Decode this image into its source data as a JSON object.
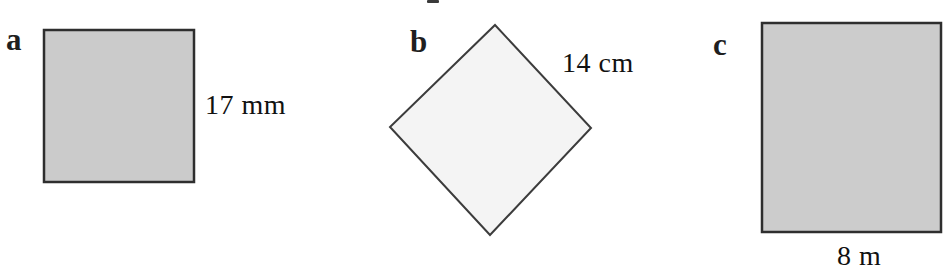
{
  "figures": [
    {
      "label": "a",
      "measurement": "17 mm",
      "shape": "square",
      "orientation": "upright",
      "fill": "#cbcbcb",
      "stroke": "#2e2e2e"
    },
    {
      "label": "b",
      "measurement": "14 cm",
      "shape": "square",
      "orientation": "rotated-45",
      "fill": "#f4f4f4",
      "stroke": "#3c3c3c"
    },
    {
      "label": "c",
      "measurement": "8 m",
      "shape": "square",
      "orientation": "upright",
      "fill": "#cccccc",
      "stroke": "#2e2e2e"
    }
  ],
  "colors": {
    "background": "#ffffff",
    "outline": "#2e2e2e",
    "text": "#1a1a1a"
  }
}
